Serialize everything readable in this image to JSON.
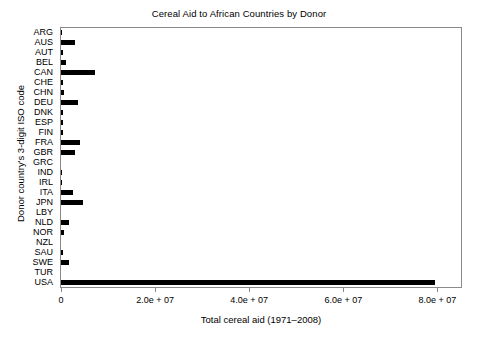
{
  "chart_data": {
    "type": "bar",
    "orientation": "horizontal",
    "title": "Cereal Aid to African Countries by Donor",
    "xlabel": "Total cereal aid (1971–2008)",
    "ylabel": "Donor country's 3-digit ISO code",
    "xlim": [
      0,
      85000000
    ],
    "ylim": null,
    "grid": false,
    "legend": null,
    "bar_color": "#000000",
    "frame_color": "#8a8a8a",
    "xticks": [
      0,
      20000000,
      40000000,
      60000000,
      80000000
    ],
    "xtick_labels": [
      "0",
      "2.0e + 07",
      "4.0e + 07",
      "6.0e + 07",
      "8.0e + 07"
    ],
    "categories": [
      "ARG",
      "AUS",
      "AUT",
      "BEL",
      "CAN",
      "CHE",
      "CHN",
      "DEU",
      "DNK",
      "ESP",
      "FIN",
      "FRA",
      "GBR",
      "GRC",
      "IND",
      "IRL",
      "ITA",
      "JPN",
      "LBY",
      "NLD",
      "NOR",
      "NZL",
      "SAU",
      "SWE",
      "TUR",
      "USA"
    ],
    "values": [
      120000,
      2900000,
      420000,
      1050000,
      7300000,
      520000,
      560000,
      3700000,
      480000,
      450000,
      420000,
      3950000,
      2900000,
      60000,
      210000,
      230000,
      2500000,
      4600000,
      80000,
      1700000,
      620000,
      70000,
      400000,
      1700000,
      40000,
      79500000
    ]
  }
}
